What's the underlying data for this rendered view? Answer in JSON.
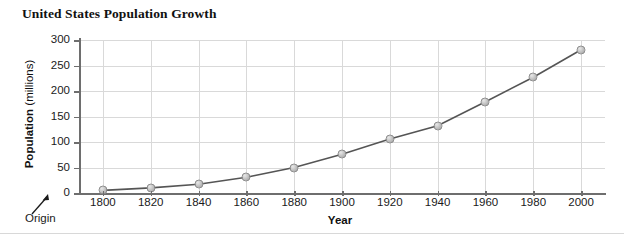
{
  "chart_data": {
    "type": "line",
    "title": "United States Population Growth",
    "xlabel": "Year",
    "ylabel_bold": "Population",
    "ylabel_regular": "(millions)",
    "ylabel_full": "Population (millions)",
    "x": [
      1800,
      1820,
      1840,
      1860,
      1880,
      1900,
      1920,
      1940,
      1960,
      1980,
      2000
    ],
    "values": [
      5,
      10,
      17,
      31,
      50,
      76,
      106,
      132,
      179,
      227,
      281
    ],
    "xticklabels": [
      "1800",
      "1820",
      "1840",
      "1860",
      "1880",
      "1900",
      "1920",
      "1940",
      "1960",
      "1980",
      "2000"
    ],
    "yticklabels": [
      "0",
      "50",
      "100",
      "150",
      "200",
      "250",
      "300"
    ],
    "yticks": [
      0,
      50,
      100,
      150,
      200,
      250,
      300
    ],
    "xlim": [
      1790,
      2010
    ],
    "ylim": [
      0,
      300
    ],
    "grid": true,
    "legend": false,
    "series_color": "#555555",
    "marker_color": "#c0c0c0",
    "grid_color": "#d9d9d9",
    "axis_color": "#6e6e6e"
  },
  "annotations": {
    "origin_label": "Origin"
  }
}
